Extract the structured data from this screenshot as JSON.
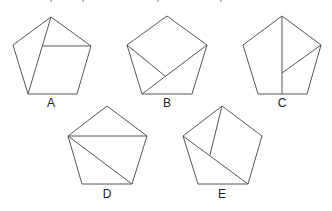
{
  "figure": {
    "stroke_color": "#555555",
    "label_color": "#222222",
    "pentagons": [
      {
        "label": "A",
        "label_pos": [
          51,
          97
        ],
        "vertices": [
          [
            51,
            17
          ],
          [
            91,
            46
          ],
          [
            77,
            94
          ],
          [
            28,
            94
          ],
          [
            13,
            45
          ]
        ],
        "internal_lines": [
          [
            [
              51,
              17
            ],
            [
              28,
              94
            ]
          ],
          [
            [
              43,
              46
            ],
            [
              91,
              46
            ]
          ]
        ]
      },
      {
        "label": "B",
        "label_pos": [
          167,
          97
        ],
        "vertices": [
          [
            167,
            16
          ],
          [
            207,
            45
          ],
          [
            192,
            94
          ],
          [
            142,
            94
          ],
          [
            127,
            45
          ]
        ],
        "internal_lines": [
          [
            [
              207,
              45
            ],
            [
              142,
              94
            ]
          ],
          [
            [
              127,
              45
            ],
            [
              165,
              76
            ]
          ]
        ]
      },
      {
        "label": "C",
        "label_pos": [
          282,
          97
        ],
        "vertices": [
          [
            282,
            16
          ],
          [
            321,
            45
          ],
          [
            307,
            94
          ],
          [
            258,
            94
          ],
          [
            243,
            45
          ]
        ],
        "internal_lines": [
          [
            [
              282,
              16
            ],
            [
              282,
              94
            ]
          ],
          [
            [
              321,
              45
            ],
            [
              282,
              73
            ]
          ]
        ]
      },
      {
        "label": "D",
        "label_pos": [
          107,
          188
        ],
        "vertices": [
          [
            107,
            106
          ],
          [
            147,
            136
          ],
          [
            132,
            184
          ],
          [
            82,
            184
          ],
          [
            68,
            136
          ]
        ],
        "internal_lines": [
          [
            [
              68,
              136
            ],
            [
              147,
              136
            ]
          ],
          [
            [
              68,
              136
            ],
            [
              132,
              184
            ]
          ]
        ]
      },
      {
        "label": "E",
        "label_pos": [
          222,
          188
        ],
        "vertices": [
          [
            222,
            106
          ],
          [
            262,
            136
          ],
          [
            248,
            184
          ],
          [
            198,
            184
          ],
          [
            183,
            136
          ]
        ],
        "internal_lines": [
          [
            [
              183,
              136
            ],
            [
              248,
              184
            ]
          ],
          [
            [
              222,
              106
            ],
            [
              210,
              155
            ]
          ]
        ]
      }
    ]
  }
}
